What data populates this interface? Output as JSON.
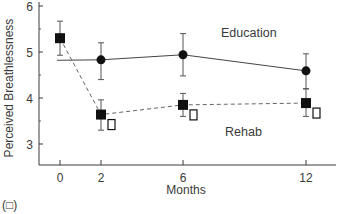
{
  "panel_label": "(□)",
  "chart_data": {
    "type": "line",
    "title": "",
    "xlabel": "Months",
    "ylabel": "Perceived Breathlessness",
    "x": [
      0,
      2,
      6,
      12
    ],
    "x_tick_labels": [
      "0",
      "2",
      "6",
      "12"
    ],
    "y_ticks": [
      3,
      4,
      5,
      6
    ],
    "y_tick_labels": [
      "3",
      "4",
      "5",
      "6"
    ],
    "ylim": [
      2.5,
      6.0
    ],
    "xlim": [
      -1.2,
      14
    ],
    "grid": false,
    "legend": "inline labels",
    "series": [
      {
        "name": "Education",
        "marker": "circle",
        "line_style": "solid",
        "x": [
          0,
          2,
          6,
          12
        ],
        "values": [
          null,
          4.83,
          4.94,
          4.59
        ],
        "error_low": [
          null,
          4.4,
          4.48,
          4.2
        ],
        "error_high": [
          null,
          5.2,
          5.4,
          4.96
        ],
        "baseline_start": 4.82,
        "label_pos": {
          "x": 221,
          "y": 37
        }
      },
      {
        "name": "Rehab",
        "marker": "square",
        "line_style": "dashed",
        "x": [
          0,
          2,
          6,
          12
        ],
        "values": [
          5.3,
          3.64,
          3.85,
          3.89
        ],
        "error_low": [
          4.93,
          3.3,
          3.6,
          3.6
        ],
        "error_high": [
          5.67,
          3.96,
          4.1,
          4.2
        ],
        "label_pos": {
          "x": 225,
          "y": 136
        }
      }
    ],
    "annotations": [
      {
        "text": "□",
        "near": "Rehab month 2",
        "meaning": "open square marker"
      },
      {
        "text": "□",
        "near": "Rehab month 6",
        "meaning": "open square marker"
      },
      {
        "text": "□",
        "near": "Rehab month 12",
        "meaning": "open square marker"
      }
    ]
  }
}
